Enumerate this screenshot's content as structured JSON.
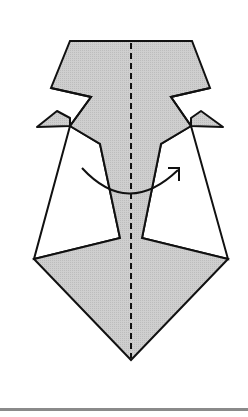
{
  "diagram": {
    "type": "origami-fold-step",
    "fill_color": "#c8c8c8",
    "stroke_color": "#111111",
    "background": "#ffffff",
    "fold_line": "valley (dashed vertical center)",
    "action": "turn over / fold behind (curved arrow)",
    "footer_rule_color": "#8a8a8a"
  }
}
